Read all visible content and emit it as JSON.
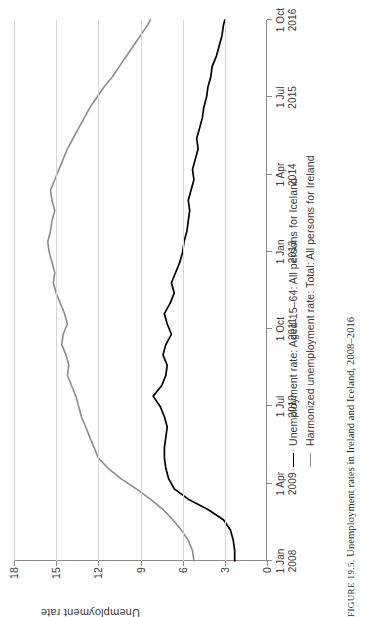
{
  "figure": {
    "caption_label": "FIGURE 19.5.",
    "caption_text": "Unemployment rates in Ireland and Iceland, 2008–2016"
  },
  "colors": {
    "iceland_line": "#000000",
    "ireland_line": "#8d8d8d",
    "gridline": "#d6d6d6",
    "axis": "#8a8a8a",
    "text": "#3a3a3a",
    "background": "#ffffff"
  },
  "legend": {
    "position": "below-plot",
    "items": [
      {
        "label": "Unemployment rate: Aged 15–64: All persons for Iceland",
        "color": "#000000"
      },
      {
        "label": "Harmonized unemployment rate: Total: All persons for Ireland",
        "color": "#8d8d8d"
      }
    ]
  },
  "chart_data": {
    "type": "line",
    "title": "Unemployment rates in Ireland and Iceland, 2008–2016",
    "xlabel": "",
    "ylabel": "Unemployment rate",
    "ylim": [
      0,
      18
    ],
    "yticks": [
      0,
      3,
      6,
      9,
      12,
      15,
      18
    ],
    "ytick_labels": [
      "0",
      "3",
      "6",
      "9",
      "12",
      "15",
      "18"
    ],
    "grid": "horizontal-only",
    "xtick_labels": [
      {
        "line1": "1 Jan",
        "line2": "2008"
      },
      {
        "line1": "1 Apr",
        "line2": "2009"
      },
      {
        "line1": "1 Jul",
        "line2": "2010"
      },
      {
        "line1": "1 Oct",
        "line2": "2011"
      },
      {
        "line1": "1 Jan",
        "line2": "2013"
      },
      {
        "line1": "1 Apr",
        "line2": "2014"
      },
      {
        "line1": "1 Jul",
        "line2": "2015"
      },
      {
        "line1": "1 Oct",
        "line2": "2016"
      }
    ],
    "x_range_months": [
      0,
      105
    ],
    "x_tick_months": [
      0,
      15,
      30,
      45,
      60,
      75,
      90,
      105
    ],
    "series": [
      {
        "name": "Unemployment rate: Aged 15–64: All persons for Iceland",
        "color": "#000000",
        "x_months": [
          0,
          2,
          4,
          6,
          8,
          10,
          12,
          14,
          16,
          18,
          20,
          22,
          24,
          26,
          28,
          30,
          32,
          34,
          36,
          38,
          40,
          42,
          44,
          46,
          48,
          50,
          52,
          54,
          56,
          58,
          60,
          62,
          64,
          66,
          68,
          70,
          72,
          74,
          76,
          78,
          80,
          82,
          84,
          86,
          88,
          90,
          92,
          94,
          96,
          98,
          100,
          102,
          104,
          105
        ],
        "values": [
          2.3,
          2.3,
          2.4,
          2.6,
          3.1,
          4.2,
          5.6,
          6.6,
          7.0,
          7.2,
          7.3,
          7.3,
          7.2,
          7.1,
          7.3,
          7.6,
          8.1,
          7.5,
          7.2,
          7.1,
          7.4,
          7.2,
          6.8,
          7.1,
          7.3,
          6.9,
          6.6,
          6.8,
          6.5,
          6.2,
          6.0,
          5.9,
          5.7,
          5.6,
          5.5,
          5.6,
          5.4,
          5.2,
          5.3,
          5.1,
          4.9,
          5.0,
          4.8,
          4.6,
          4.5,
          4.3,
          4.2,
          4.0,
          3.9,
          3.6,
          3.4,
          3.2,
          3.1,
          3.0
        ]
      },
      {
        "name": "Harmonized unemployment rate: Total: All persons for Ireland",
        "color": "#8d8d8d",
        "x_months": [
          0,
          2,
          4,
          6,
          8,
          10,
          12,
          14,
          16,
          18,
          20,
          22,
          24,
          26,
          28,
          30,
          32,
          34,
          36,
          38,
          40,
          42,
          44,
          46,
          48,
          50,
          52,
          54,
          56,
          58,
          60,
          62,
          64,
          66,
          68,
          70,
          72,
          74,
          76,
          78,
          80,
          82,
          84,
          86,
          88,
          90,
          92,
          94,
          96,
          98,
          100,
          102,
          104,
          105
        ],
        "values": [
          5.2,
          5.3,
          5.6,
          6.1,
          6.7,
          7.4,
          8.3,
          9.3,
          10.4,
          11.3,
          12.0,
          12.3,
          12.6,
          12.9,
          13.2,
          13.4,
          13.6,
          13.9,
          14.2,
          14.1,
          14.3,
          14.6,
          14.5,
          14.2,
          14.4,
          14.7,
          15.0,
          15.2,
          15.1,
          15.3,
          15.5,
          15.6,
          15.4,
          15.3,
          15.1,
          15.3,
          15.4,
          15.1,
          14.8,
          14.5,
          14.2,
          13.8,
          13.4,
          13.0,
          12.6,
          12.1,
          11.6,
          11.0,
          10.5,
          10.0,
          9.5,
          9.0,
          8.5,
          8.3
        ]
      }
    ],
    "annotations": []
  }
}
